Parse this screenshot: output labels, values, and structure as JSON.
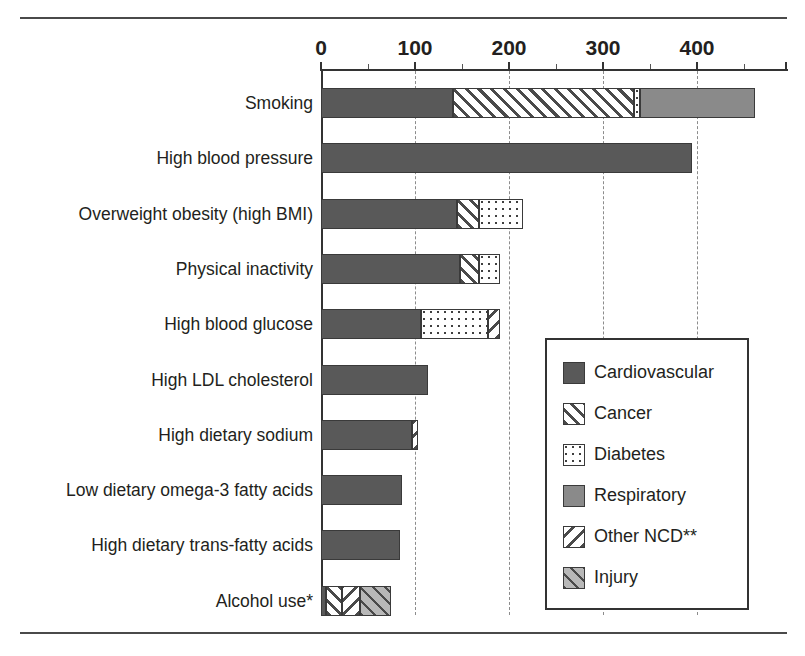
{
  "chart_data": {
    "type": "bar",
    "orientation": "horizontal",
    "stacked": true,
    "title": "",
    "xlabel": "",
    "ylabel": "",
    "xlim": [
      0,
      496
    ],
    "xticks": [
      0,
      100,
      200,
      300,
      400
    ],
    "xtick_labels": [
      "0",
      "100",
      "200",
      "300",
      "400"
    ],
    "minor_ticks": [
      50,
      150,
      250,
      350,
      450
    ],
    "grid": "vertical dashed at 100,200,300,400",
    "legend_position": "center-right inside plot",
    "categories": [
      "Smoking",
      "High blood pressure",
      "Overweight obesity (high BMI)",
      "Physical inactivity",
      "High blood glucose",
      "High LDL cholesterol",
      "High dietary sodium",
      "Low dietary omega-3 fatty acids",
      "High dietary trans-fatty acids",
      "Alcohol use*"
    ],
    "series": [
      {
        "name": "Cardiovascular",
        "values": [
          140,
          395,
          145,
          148,
          106,
          114,
          97,
          86,
          84,
          5
        ]
      },
      {
        "name": "Cancer",
        "values": [
          193,
          0,
          23,
          20,
          0,
          0,
          0,
          0,
          0,
          17
        ]
      },
      {
        "name": "Diabetes",
        "values": [
          6,
          0,
          47,
          22,
          72,
          0,
          0,
          0,
          0,
          0
        ]
      },
      {
        "name": "Respiratory",
        "values": [
          123,
          0,
          0,
          0,
          0,
          0,
          0,
          0,
          0,
          0
        ]
      },
      {
        "name": "Other NCD**",
        "values": [
          0,
          0,
          0,
          0,
          12,
          0,
          6,
          0,
          0,
          20
        ]
      },
      {
        "name": "Injury",
        "values": [
          0,
          0,
          0,
          0,
          0,
          0,
          0,
          0,
          0,
          33
        ]
      }
    ],
    "totals": [
      462,
      395,
      215,
      190,
      190,
      114,
      103,
      86,
      84,
      75
    ]
  },
  "legend": {
    "items": [
      {
        "label": "Cardiovascular",
        "pattern": "solid-dark-gray",
        "color": "#595959"
      },
      {
        "label": "Cancer",
        "pattern": "diagonal-hatch-forward",
        "color": "#ffffff"
      },
      {
        "label": "Diabetes",
        "pattern": "dotted-grid",
        "color": "#ffffff"
      },
      {
        "label": "Respiratory",
        "pattern": "solid-medium-gray",
        "color": "#8a8a8a"
      },
      {
        "label": "Other NCD**",
        "pattern": "diagonal-hatch-backward",
        "color": "#ffffff"
      },
      {
        "label": "Injury",
        "pattern": "diagonal-hatch-on-light-gray",
        "color": "#b8b8b8"
      }
    ]
  },
  "axis": {
    "tick_labels": [
      "0",
      "100",
      "200",
      "300",
      "400"
    ]
  },
  "categories": {
    "labels": [
      "Smoking",
      "High blood pressure",
      "Overweight obesity (high BMI)",
      "Physical inactivity",
      "High blood glucose",
      "High LDL cholesterol",
      "High dietary sodium",
      "Low dietary omega-3 fatty acids",
      "High dietary trans-fatty acids",
      "Alcohol use*"
    ]
  }
}
